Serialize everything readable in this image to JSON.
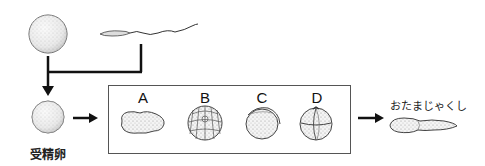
{
  "diagram": {
    "egg_label": "",
    "sperm_label": "",
    "fertilized_egg_label": "受精卵",
    "tadpole_label": "おたまじゃくし",
    "stages": [
      {
        "letter": "A",
        "description": "irregular elongated embryo"
      },
      {
        "letter": "B",
        "description": "many-cell divided embryo"
      },
      {
        "letter": "C",
        "description": "smooth embryo with groove"
      },
      {
        "letter": "D",
        "description": "four-cell divided embryo"
      }
    ],
    "colors": {
      "line": "#111111",
      "box_border": "#555555",
      "shading": "#cfcfcf"
    }
  }
}
